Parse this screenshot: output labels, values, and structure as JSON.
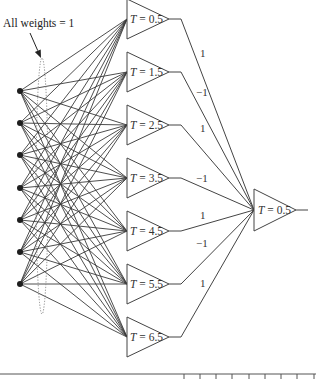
{
  "annotation": {
    "text": "All weights = 1",
    "x": 3,
    "y": 27,
    "arrow": {
      "x1": 30,
      "y1": 33,
      "x2": 41,
      "y2": 58
    }
  },
  "grouping_ellipse": {
    "cx": 42,
    "cy": 186,
    "rx": 6,
    "ry": 128
  },
  "input_layer": {
    "x": 20,
    "node_radius": 3,
    "nodes_y": [
      91,
      123,
      155,
      188,
      220,
      252,
      284
    ]
  },
  "hidden_layer": {
    "left_x": 127,
    "apex_x": 169,
    "half_height": 20,
    "stub_end_x": 181,
    "units": [
      {
        "threshold_var": "T",
        "threshold": "0.5",
        "label": "T = 0.5",
        "y": 19,
        "weight_to_output": "1",
        "weight_label_pos": [
          200,
          57
        ]
      },
      {
        "threshold_var": "T",
        "threshold": "1.5",
        "label": "T = 1.5",
        "y": 72,
        "weight_to_output": "−1",
        "weight_label_pos": [
          196,
          96
        ]
      },
      {
        "threshold_var": "T",
        "threshold": "2.5",
        "label": "T = 2.5",
        "y": 125,
        "weight_to_output": "1",
        "weight_label_pos": [
          200,
          132
        ]
      },
      {
        "threshold_var": "T",
        "threshold": "3.5",
        "label": "T = 3.5",
        "y": 178,
        "weight_to_output": "−1",
        "weight_label_pos": [
          196,
          182
        ]
      },
      {
        "threshold_var": "T",
        "threshold": "4.5",
        "label": "T = 4.5",
        "y": 231,
        "weight_to_output": "1",
        "weight_label_pos": [
          200,
          219
        ]
      },
      {
        "threshold_var": "T",
        "threshold": "5.5",
        "label": "T = 5.5",
        "y": 284,
        "weight_to_output": "−1",
        "weight_label_pos": [
          196,
          247
        ]
      },
      {
        "threshold_var": "T",
        "threshold": "6.5",
        "label": "T = 6.5",
        "y": 337,
        "weight_to_output": "1",
        "weight_label_pos": [
          200,
          287
        ]
      }
    ]
  },
  "output_unit": {
    "threshold_var": "T",
    "threshold": "0.5",
    "label": "T = 0.5",
    "left_x": 254,
    "apex_x": 296,
    "y": 210,
    "half_height": 21,
    "out_end_x": 308
  },
  "bottom_ruler": {
    "y": 374,
    "x1": 0,
    "x2": 316,
    "tick_bottom": 379,
    "ticks_x": [
      184,
      200,
      216,
      232,
      249,
      265,
      281,
      297,
      314
    ]
  },
  "colors": {
    "line": "#3a3a3a",
    "node": "#1e1e1e",
    "text": "#333333",
    "highlight_faint": "#c9a0d8"
  }
}
